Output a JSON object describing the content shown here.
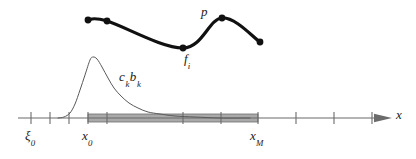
{
  "figure": {
    "title": "",
    "caption": "",
    "background_color": "#ffffff"
  },
  "labels": {
    "p": "p",
    "f_i_base": "f",
    "f_i_sub": "i",
    "ck_bk_c": "c",
    "ck_bk_c_sub": "k",
    "ck_bk_b": "b",
    "ck_bk_b_sub": "k",
    "xi0_base": "ξ",
    "xi0_sub": "0",
    "x0_base": "x",
    "x0_sub": "0",
    "xM_base": "x",
    "xM_sub": "M",
    "x_axis": "x"
  },
  "colors": {
    "curve_p": "#111111",
    "curve_basis": "#5a5a5a",
    "axis": "#6b6b6b",
    "band_fill": "#a9a9a9",
    "band_stroke": "#6e6e6e",
    "point_fill": "#111111",
    "text": "#1a1a1a"
  },
  "chart_data": {
    "type": "line",
    "title": "",
    "xlabel": "x",
    "ylabel": "",
    "grid": false,
    "legend_position": "inline-annotations",
    "axis": {
      "y_pixel": 118,
      "x_start_pixel": 18,
      "x_end_pixel": 392,
      "arrow_head": true,
      "tick_half_height": 6,
      "tick_pixels": [
        31,
        50,
        69,
        88,
        107,
        183,
        221,
        258,
        296,
        334,
        372
      ],
      "labeled_ticks": [
        {
          "pixel": 31,
          "label": "ξ0"
        },
        {
          "pixel": 88,
          "label": "x0"
        },
        {
          "pixel": 258,
          "label": "xM"
        }
      ]
    },
    "shaded_band": {
      "name": "support-band",
      "x_from_pixel": 88,
      "x_to_pixel": 258,
      "half_height_pixel": 4,
      "fill": "#a9a9a9"
    },
    "series": [
      {
        "name": "p",
        "kind": "thick-interpolating-curve",
        "annotation": "p",
        "annotation_pixel": [
          205,
          12
        ],
        "stroke_width": 3.2,
        "points_pixel": [
          [
            88,
            20
          ],
          [
            107,
            21
          ],
          [
            183,
            48
          ],
          [
            222,
            18
          ],
          [
            260,
            42
          ]
        ],
        "markers": true,
        "marker_radius": 3.4
      },
      {
        "name": "ck bk",
        "kind": "thin-basis-function",
        "annotation": "c_k b_k",
        "annotation_pixel": [
          125,
          78
        ],
        "stroke_width": 1.0,
        "points_pixel": [
          [
            58,
            118
          ],
          [
            64,
            117
          ],
          [
            70,
            113
          ],
          [
            75,
            104
          ],
          [
            80,
            90
          ],
          [
            85,
            75
          ],
          [
            90,
            60
          ],
          [
            93,
            57
          ],
          [
            97,
            59
          ],
          [
            102,
            67
          ],
          [
            108,
            78
          ],
          [
            114,
            88
          ],
          [
            121,
            96
          ],
          [
            129,
            103
          ],
          [
            138,
            108
          ],
          [
            148,
            112
          ],
          [
            160,
            114
          ],
          [
            175,
            116
          ],
          [
            195,
            117
          ],
          [
            220,
            118
          ],
          [
            250,
            118
          ]
        ]
      }
    ]
  }
}
